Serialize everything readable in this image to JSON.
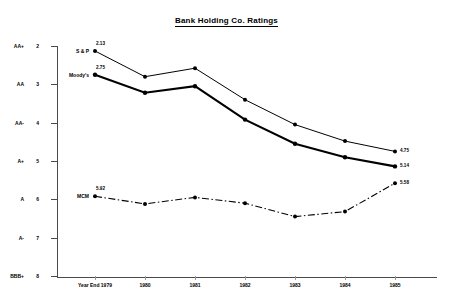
{
  "chart_data": {
    "type": "line",
    "title": "Bank Holding Co. Ratings",
    "xlabel": "",
    "ylabel": "",
    "grid": false,
    "legend_position": "inline-left",
    "y_inverted": true,
    "ylim": [
      2,
      8
    ],
    "categories": [
      "Year End 1979",
      "1980",
      "1981",
      "1982",
      "1983",
      "1984",
      "1985"
    ],
    "y_ticks": [
      {
        "value": 2,
        "grade": "AA+",
        "num": "2"
      },
      {
        "value": 3,
        "grade": "AA",
        "num": "3"
      },
      {
        "value": 4,
        "grade": "AA-",
        "num": "4"
      },
      {
        "value": 5,
        "grade": "A+",
        "num": "5"
      },
      {
        "value": 6,
        "grade": "A",
        "num": "6"
      },
      {
        "value": 7,
        "grade": "A-",
        "num": "7"
      },
      {
        "value": 8,
        "grade": "BBB+",
        "num": "8"
      }
    ],
    "series": [
      {
        "name": "S & P",
        "style": "solid-thin",
        "values": [
          2.13,
          2.8,
          2.58,
          3.4,
          4.05,
          4.48,
          4.75
        ],
        "start_label": "2.13",
        "end_label": "4.75"
      },
      {
        "name": "Moody's",
        "style": "solid-thick",
        "values": [
          2.75,
          3.22,
          3.05,
          3.92,
          4.55,
          4.9,
          5.14
        ],
        "start_label": "2.75",
        "end_label": "5.14"
      },
      {
        "name": "MCM",
        "style": "dash-dot",
        "values": [
          5.92,
          6.12,
          5.95,
          6.1,
          6.45,
          6.32,
          5.58
        ],
        "start_label": "5.92",
        "end_label": "5.58"
      }
    ]
  },
  "colors": {
    "ink": "#000000",
    "axis": "#4a4a4a",
    "background": "#ffffff"
  }
}
